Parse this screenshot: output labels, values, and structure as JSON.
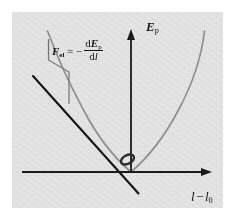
{
  "figure": {
    "kind": "physics-diagram",
    "panel": {
      "background_color": "#e9e9e9",
      "outer_background_color": "#ffffff"
    }
  },
  "axes": {
    "y_label": {
      "base": "E",
      "subscript": "p",
      "full": "Ep"
    },
    "x_label": {
      "first": "l",
      "minus": "−",
      "second": "l",
      "subscript": "0",
      "full": "l − l0"
    },
    "axis_color": "#1a1a1a",
    "origin": {
      "x": 131,
      "y": 172
    }
  },
  "annotation": {
    "formula": {
      "symbol": "F",
      "symbol_subscript": "el",
      "equals": "=",
      "minus": "−",
      "numerator_d": "d",
      "numerator_E": "E",
      "numerator_sub": "p",
      "denominator_d": "d",
      "denominator_l": "l",
      "full": "F_el = − dE_p/dl"
    },
    "leader_color": "#6f6f6f"
  },
  "curves": {
    "parabola": {
      "name": "potential-energy-parabola",
      "color": "#8c8c8c",
      "vertex": {
        "x": 131,
        "y": 172
      },
      "points": [
        [
          47,
          32
        ],
        [
          55,
          52
        ],
        [
          64,
          72
        ],
        [
          74,
          92
        ],
        [
          86,
          112
        ],
        [
          99,
          133
        ],
        [
          113,
          154
        ],
        [
          122,
          164
        ],
        [
          131,
          172
        ],
        [
          140,
          164
        ],
        [
          150,
          154
        ],
        [
          163,
          133
        ],
        [
          176,
          112
        ],
        [
          188,
          92
        ],
        [
          197,
          72
        ],
        [
          205,
          32
        ]
      ]
    },
    "tangent": {
      "name": "tangent-line",
      "color": "#1a1a1a",
      "start": {
        "x": 33,
        "y": 76
      },
      "end": {
        "x": 138,
        "y": 193
      },
      "touch_point": {
        "x": 84,
        "y": 133
      }
    }
  },
  "markers": {
    "origin_ellipse": {
      "name": "origin-ellipse-marker",
      "cx": 127,
      "cy": 160,
      "rx": 7,
      "ry": 4.2,
      "rotation": -28,
      "color": "#2a2a2a"
    }
  }
}
